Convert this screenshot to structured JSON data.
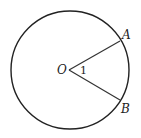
{
  "diagram": {
    "type": "circle-with-central-angle",
    "circle": {
      "cx": 70,
      "cy": 70,
      "r": 59,
      "stroke": "#222222"
    },
    "center": {
      "label": "O",
      "x": 69,
      "y": 70
    },
    "points": [
      {
        "label": "A",
        "x": 120,
        "y": 41
      },
      {
        "label": "B",
        "x": 120,
        "y": 100
      }
    ],
    "angle_label": "1"
  }
}
